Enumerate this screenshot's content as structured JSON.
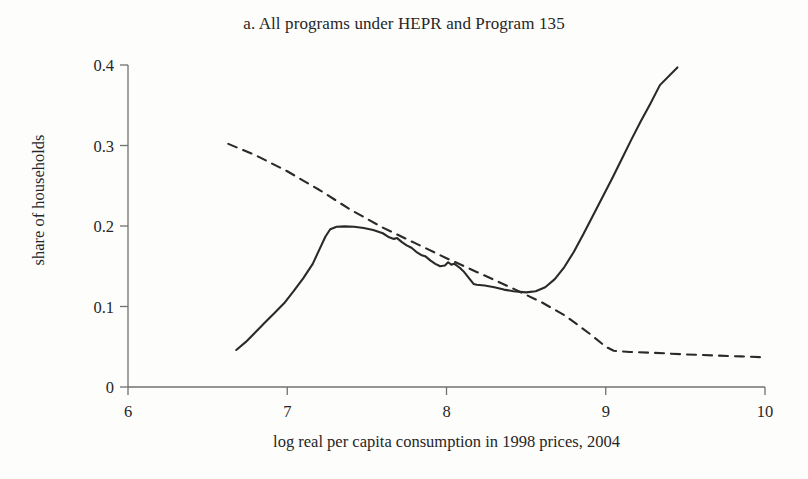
{
  "figure": {
    "panel_label": "a.",
    "background_color": "#fdfdfc",
    "line_color": "#2a2a2a",
    "axis_color": "#707070"
  },
  "chart_data": {
    "type": "line",
    "title": "a. All programs under HEPR and Program 135",
    "xlabel": "log real per capita consumption in 1998 prices, 2004",
    "ylabel": "share of households",
    "xlim": [
      6,
      10
    ],
    "ylim": [
      0,
      0.4
    ],
    "xticks": [
      6,
      7,
      8,
      9,
      10
    ],
    "xtick_labels": [
      "6",
      "7",
      "8",
      "9",
      "10"
    ],
    "yticks": [
      0,
      0.1,
      0.2,
      0.3,
      0.4
    ],
    "ytick_labels": [
      "0",
      "0.1",
      "0.2",
      "0.3",
      "0.4"
    ],
    "grid": false,
    "legend": null,
    "legend_position": "none",
    "series": [
      {
        "name": "solid-curve",
        "style": "solid",
        "color": "#2a2a2a",
        "points": [
          [
            6.68,
            0.046
          ],
          [
            6.74,
            0.056
          ],
          [
            6.8,
            0.068
          ],
          [
            6.86,
            0.08
          ],
          [
            6.92,
            0.092
          ],
          [
            6.98,
            0.104
          ],
          [
            7.04,
            0.119
          ],
          [
            7.1,
            0.135
          ],
          [
            7.16,
            0.153
          ],
          [
            7.2,
            0.17
          ],
          [
            7.24,
            0.187
          ],
          [
            7.27,
            0.196
          ],
          [
            7.31,
            0.199
          ],
          [
            7.36,
            0.1995
          ],
          [
            7.42,
            0.199
          ],
          [
            7.48,
            0.1975
          ],
          [
            7.54,
            0.195
          ],
          [
            7.6,
            0.191
          ],
          [
            7.64,
            0.186
          ],
          [
            7.67,
            0.184
          ],
          [
            7.69,
            0.185
          ],
          [
            7.72,
            0.18
          ],
          [
            7.75,
            0.176
          ],
          [
            7.78,
            0.173
          ],
          [
            7.81,
            0.168
          ],
          [
            7.84,
            0.164
          ],
          [
            7.87,
            0.162
          ],
          [
            7.9,
            0.157
          ],
          [
            7.93,
            0.153
          ],
          [
            7.96,
            0.15
          ],
          [
            7.99,
            0.151
          ],
          [
            8.01,
            0.155
          ],
          [
            8.03,
            0.152
          ],
          [
            8.05,
            0.153
          ],
          [
            8.07,
            0.15
          ],
          [
            8.09,
            0.147
          ],
          [
            8.11,
            0.143
          ],
          [
            8.13,
            0.138
          ],
          [
            8.15,
            0.133
          ],
          [
            8.17,
            0.128
          ],
          [
            8.19,
            0.127
          ],
          [
            8.24,
            0.126
          ],
          [
            8.3,
            0.124
          ],
          [
            8.36,
            0.121
          ],
          [
            8.42,
            0.119
          ],
          [
            8.5,
            0.1175
          ],
          [
            8.56,
            0.119
          ],
          [
            8.62,
            0.124
          ],
          [
            8.68,
            0.134
          ],
          [
            8.74,
            0.149
          ],
          [
            8.8,
            0.168
          ],
          [
            8.86,
            0.19
          ],
          [
            8.92,
            0.213
          ],
          [
            8.98,
            0.236
          ],
          [
            9.04,
            0.259
          ],
          [
            9.1,
            0.283
          ],
          [
            9.16,
            0.307
          ],
          [
            9.22,
            0.33
          ],
          [
            9.28,
            0.352
          ],
          [
            9.34,
            0.375
          ],
          [
            9.45,
            0.397
          ]
        ]
      },
      {
        "name": "dashed-curve",
        "style": "dashed",
        "color": "#2a2a2a",
        "points": [
          [
            6.63,
            0.302
          ],
          [
            6.8,
            0.288
          ],
          [
            7.0,
            0.268
          ],
          [
            7.2,
            0.245
          ],
          [
            7.4,
            0.22
          ],
          [
            7.6,
            0.198
          ],
          [
            7.8,
            0.179
          ],
          [
            8.0,
            0.16
          ],
          [
            8.2,
            0.142
          ],
          [
            8.4,
            0.124
          ],
          [
            8.6,
            0.105
          ],
          [
            8.75,
            0.088
          ],
          [
            8.9,
            0.066
          ],
          [
            9.0,
            0.05
          ],
          [
            9.05,
            0.045
          ],
          [
            9.15,
            0.0435
          ],
          [
            9.3,
            0.0425
          ],
          [
            9.5,
            0.0405
          ],
          [
            9.7,
            0.039
          ],
          [
            9.85,
            0.038
          ],
          [
            9.99,
            0.037
          ]
        ]
      }
    ]
  }
}
